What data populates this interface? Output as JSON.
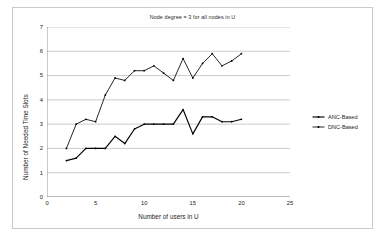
{
  "chart_data": {
    "type": "line",
    "title": "Node degree = 3 for all nodes in U",
    "xlabel": "Number of users in U",
    "ylabel": "Number of Needed Time Slots",
    "xlim": [
      0,
      25
    ],
    "ylim": [
      0,
      7
    ],
    "xticks": [
      0,
      5,
      10,
      15,
      20,
      25
    ],
    "yticks": [
      0,
      1,
      2,
      3,
      4,
      5,
      6,
      7
    ],
    "grid": "horizontal",
    "legend_position": "right",
    "x": [
      2,
      3,
      4,
      5,
      6,
      7,
      8,
      9,
      10,
      11,
      12,
      13,
      14,
      15,
      16,
      17,
      18,
      19,
      20
    ],
    "series": [
      {
        "name": "ANC-Based",
        "color": "#000000",
        "values": [
          1.5,
          1.6,
          2.0,
          2.0,
          2.0,
          2.5,
          2.2,
          2.8,
          3.0,
          3.0,
          3.0,
          3.0,
          3.6,
          2.6,
          3.3,
          3.3,
          3.1,
          3.1,
          3.2
        ]
      },
      {
        "name": "DNC-Based",
        "color": "#000000",
        "values": [
          2.0,
          3.0,
          3.2,
          3.1,
          4.2,
          4.9,
          4.8,
          5.2,
          5.2,
          5.4,
          5.1,
          4.8,
          5.7,
          4.9,
          5.5,
          5.9,
          5.4,
          5.6,
          5.9
        ]
      }
    ]
  },
  "ticks": {
    "x": [
      "0",
      "5",
      "10",
      "15",
      "20",
      "25"
    ],
    "y": [
      "0",
      "1",
      "2",
      "3",
      "4",
      "5",
      "6",
      "7"
    ]
  },
  "legend": {
    "items": [
      {
        "label": "ANC-Based"
      },
      {
        "label": "DNC-Based"
      }
    ]
  }
}
